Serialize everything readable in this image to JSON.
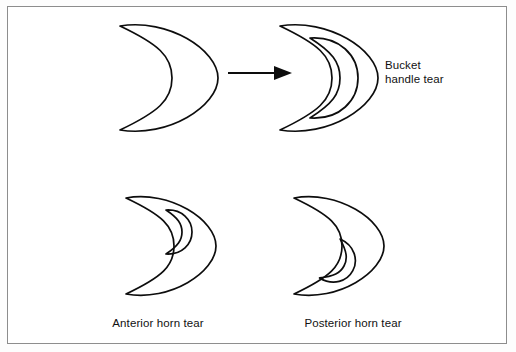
{
  "figure": {
    "background_color": "#ffffff",
    "frame_color": "#8d8d8d",
    "stroke_color": "#0d0d0d"
  },
  "labels": {
    "bucket_handle": "Bucket\nhandle tear",
    "anterior_horn": "Anterior horn tear",
    "posterior_horn": "Posterior horn tear"
  },
  "diagram_data": {
    "type": "diagram",
    "panels": [
      {
        "id": "intact-meniscus",
        "position": "top-left",
        "label": "",
        "description": "Intact crescent-shaped meniscus, concavity facing left"
      },
      {
        "id": "bucket-handle-tear",
        "position": "top-right",
        "label": "Bucket handle tear",
        "description": "Crescent meniscus with a large inner crescent fragment displaced centrally"
      },
      {
        "id": "anterior-horn-tear",
        "position": "bottom-left",
        "label": "Anterior horn tear",
        "description": "Crescent meniscus with small crescent-shaped tear near the upper (anterior) horn"
      },
      {
        "id": "posterior-horn-tear",
        "position": "bottom-right",
        "label": "Posterior horn tear",
        "description": "Crescent meniscus with small crescent-shaped tear near the lower (posterior) horn"
      }
    ],
    "connectors": [
      {
        "id": "transform-arrow",
        "from": "intact-meniscus",
        "to": "bucket-handle-tear",
        "direction": "left-to-right",
        "style": "solid-line-with-filled-triangle-head"
      }
    ]
  }
}
